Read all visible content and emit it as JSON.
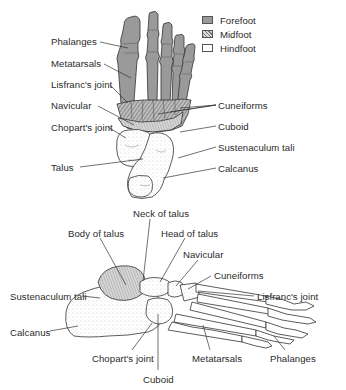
{
  "legend": {
    "items": [
      {
        "label": "Forefoot",
        "fill": "#9a9a9a",
        "pattern": "solid-gray"
      },
      {
        "label": "Midfoot",
        "fill": "#bbbbbb",
        "pattern": "hatched"
      },
      {
        "label": "Hindfoot",
        "fill": "#ffffff",
        "pattern": "empty"
      }
    ]
  },
  "dorsal_view": {
    "labels_left": [
      {
        "text": "Phalanges",
        "x": 51,
        "y": 36
      },
      {
        "text": "Metatarsals",
        "x": 51,
        "y": 58
      },
      {
        "text": "Lisfranc's joint",
        "x": 51,
        "y": 79
      },
      {
        "text": "Navicular",
        "x": 51,
        "y": 100
      },
      {
        "text": "Chopart's joint",
        "x": 51,
        "y": 122
      },
      {
        "text": "Talus",
        "x": 51,
        "y": 162
      }
    ],
    "labels_right": [
      {
        "text": "Cuneiforms",
        "x": 218,
        "y": 100
      },
      {
        "text": "Cuboid",
        "x": 218,
        "y": 121
      },
      {
        "text": "Sustenaculum tali",
        "x": 218,
        "y": 142
      },
      {
        "text": "Calcanus",
        "x": 218,
        "y": 163
      }
    ]
  },
  "lateral_view": {
    "labels": [
      {
        "text": "Neck of talus",
        "x": 133,
        "y": 208
      },
      {
        "text": "Body of talus",
        "x": 68,
        "y": 228
      },
      {
        "text": "Head of talus",
        "x": 161,
        "y": 228
      },
      {
        "text": "Navicular",
        "x": 183,
        "y": 249
      },
      {
        "text": "Cuneiforms",
        "x": 214,
        "y": 270
      },
      {
        "text": "Sustenaculum tali",
        "x": 10,
        "y": 291
      },
      {
        "text": "Lisfranc's joint",
        "x": 257,
        "y": 291
      },
      {
        "text": "Calcanus",
        "x": 10,
        "y": 327
      },
      {
        "text": "Chopart's joint",
        "x": 92,
        "y": 353
      },
      {
        "text": "Metatarsals",
        "x": 192,
        "y": 353
      },
      {
        "text": "Phalanges",
        "x": 270,
        "y": 353
      },
      {
        "text": "Cuboid",
        "x": 143,
        "y": 374
      }
    ]
  }
}
